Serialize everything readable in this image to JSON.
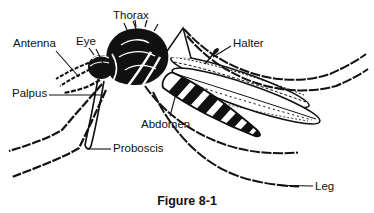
{
  "figure": {
    "caption": "Figure 8-1",
    "labels": {
      "antenna": "Antenna",
      "eye": "Eye",
      "thorax": "Thorax",
      "halter": "Halter",
      "palpus": "Palpus",
      "abdomen": "Abdomen",
      "proboscis": "Proboscis",
      "leg": "Leg"
    },
    "colors": {
      "ink": "#111111",
      "paper": "#ffffff"
    }
  }
}
